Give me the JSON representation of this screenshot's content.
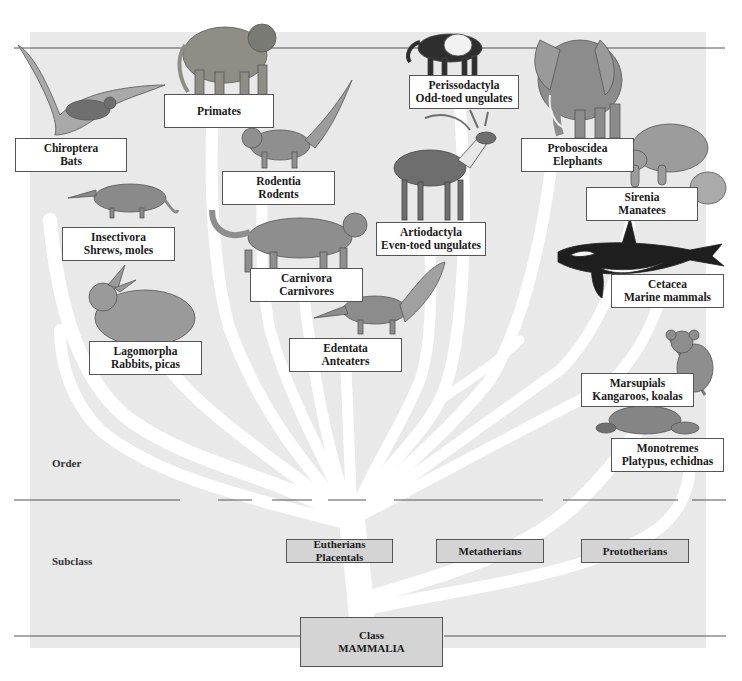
{
  "diagram": {
    "type": "phylogenetic-tree",
    "colors": {
      "panel_background": "#e9e9e9",
      "branch": "#ffffff",
      "label_box": "#ffffff",
      "subclass_box": "#d4d4d4",
      "rule_line": "#555555"
    },
    "levels": {
      "order": "Order",
      "subclass": "Subclass"
    },
    "class": {
      "line1": "Class",
      "line2": "MAMMALIA"
    },
    "subclasses": [
      {
        "line1": "Eutherians",
        "line2": "Placentals"
      },
      {
        "line1": "Metatherians",
        "line2": ""
      },
      {
        "line1": "Prototherians",
        "line2": ""
      }
    ],
    "orders": [
      {
        "name": "Chiroptera",
        "common": "Bats",
        "animal_icon": "bat-icon"
      },
      {
        "name": "Primates",
        "common": "",
        "animal_icon": "baboon-icon"
      },
      {
        "name": "Rodentia",
        "common": "Rodents",
        "animal_icon": "squirrel-icon"
      },
      {
        "name": "Perissodactyla",
        "common": "Odd-toed ungulates",
        "animal_icon": "tapir-icon"
      },
      {
        "name": "Proboscidea",
        "common": "Elephants",
        "animal_icon": "elephant-icon"
      },
      {
        "name": "Sirenia",
        "common": "Manatees",
        "animal_icon": "manatee-icon"
      },
      {
        "name": "Insectivora",
        "common": "Shrews, moles",
        "animal_icon": "shrew-icon"
      },
      {
        "name": "Artiodactyla",
        "common": "Even-toed ungulates",
        "animal_icon": "deer-icon"
      },
      {
        "name": "Carnivora",
        "common": "Carnivores",
        "animal_icon": "cougar-icon"
      },
      {
        "name": "Cetacea",
        "common": "Marine mammals",
        "animal_icon": "orca-icon"
      },
      {
        "name": "Lagomorpha",
        "common": "Rabbits, picas",
        "animal_icon": "rabbit-icon"
      },
      {
        "name": "Edentata",
        "common": "Anteaters",
        "animal_icon": "anteater-icon"
      },
      {
        "name": "Marsupials",
        "common": "Kangaroos, koalas",
        "animal_icon": "koala-icon"
      },
      {
        "name": "Monotremes",
        "common": "Platypus, echidnas",
        "animal_icon": "platypus-icon"
      }
    ]
  }
}
